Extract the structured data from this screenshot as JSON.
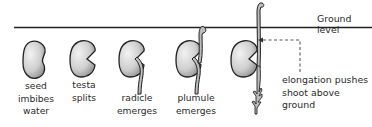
{
  "diagram": {
    "ground_label": "Ground level",
    "stages": [
      {
        "id": "imbibition",
        "label_lines": [
          "seed",
          "imbibes",
          "water"
        ]
      },
      {
        "id": "testa",
        "label_lines": [
          "testa",
          "splits"
        ]
      },
      {
        "id": "radicle",
        "label_lines": [
          "radicle",
          "emerges"
        ]
      },
      {
        "id": "plumule",
        "label_lines": [
          "plumule",
          "emerges"
        ]
      },
      {
        "id": "elongation",
        "label_lines": []
      }
    ],
    "annotation": {
      "lines": [
        "elongation pushes",
        "shoot above",
        "ground"
      ],
      "points_to": "elongation"
    },
    "colors": {
      "seed_fill_light": "#e6e6e6",
      "seed_fill_dark": "#9a9a9a",
      "outline": "#222222",
      "ground_line": "#222222",
      "dashed_arrow": "#555555"
    }
  }
}
